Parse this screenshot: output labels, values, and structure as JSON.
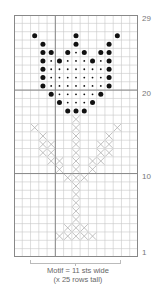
{
  "chart_data": {
    "type": "table",
    "grid": {
      "columns": 15,
      "rows": 29,
      "row_numbering": "bottom-to-top",
      "thick_lines_above_rows": [
        20,
        10
      ],
      "thick_line_after_column": 5
    },
    "row_labels": [
      "29",
      "20",
      "10",
      "1"
    ],
    "legend": {
      "large_dot": "bobble/contrast stitch (outline)",
      "small_dot": "contrast stitch (fill)",
      "x": "cross stitch (stem and leaves)"
    },
    "cells": {
      "large_dot": [
        [
          27,
          [
            2,
            7,
            12
          ]
        ],
        [
          26,
          [
            3,
            7,
            11
          ]
        ],
        [
          25,
          [
            3,
            4,
            6,
            8,
            10,
            11
          ]
        ],
        [
          24,
          [
            3,
            5,
            9,
            11
          ]
        ],
        [
          23,
          [
            3,
            11
          ]
        ],
        [
          22,
          [
            3,
            11
          ]
        ],
        [
          21,
          [
            3,
            11
          ]
        ],
        [
          20,
          [
            4,
            10
          ]
        ],
        [
          19,
          [
            5,
            9
          ]
        ],
        [
          18,
          [
            6,
            7,
            8
          ]
        ]
      ],
      "small_dot": [
        [
          25,
          [
            7
          ]
        ],
        [
          24,
          [
            4,
            6,
            7,
            8,
            10
          ]
        ],
        [
          23,
          [
            4,
            5,
            6,
            7,
            8,
            9,
            10
          ]
        ],
        [
          22,
          [
            4,
            5,
            6,
            7,
            8,
            9,
            10
          ]
        ],
        [
          21,
          [
            4,
            5,
            6,
            7,
            8,
            9,
            10
          ]
        ],
        [
          20,
          [
            5,
            6,
            7,
            8,
            9
          ]
        ],
        [
          19,
          [
            6,
            7,
            8
          ]
        ]
      ],
      "cross": [
        [
          17,
          [
            7
          ]
        ],
        [
          16,
          [
            2,
            7,
            12
          ]
        ],
        [
          15,
          [
            3,
            7,
            11
          ]
        ],
        [
          14,
          [
            3,
            4,
            7,
            10,
            11
          ]
        ],
        [
          13,
          [
            3,
            4,
            7,
            10,
            11
          ]
        ],
        [
          12,
          [
            4,
            5,
            7,
            9,
            10
          ]
        ],
        [
          11,
          [
            5,
            7,
            9
          ]
        ],
        [
          10,
          [
            6,
            7,
            8
          ]
        ],
        [
          9,
          [
            7
          ]
        ],
        [
          8,
          [
            7
          ]
        ],
        [
          7,
          [
            7
          ]
        ],
        [
          6,
          [
            7
          ]
        ],
        [
          5,
          [
            7
          ]
        ],
        [
          4,
          [
            6,
            7,
            8
          ]
        ],
        [
          3,
          [
            5,
            6,
            7,
            8,
            9
          ]
        ]
      ]
    },
    "motif_bracket": {
      "from_column": 2,
      "to_column": 12
    },
    "caption": [
      "Motif = 11 sts wide",
      "(x 25 rows tall)"
    ]
  },
  "labels": {
    "row_29": "29",
    "row_20": "20",
    "row_10": "10",
    "row_1": "1"
  },
  "caption": {
    "line1": "Motif = 11 sts wide",
    "line2": "(x 25 rows tall)"
  },
  "colors": {
    "grid_line": "#c8c8c8",
    "thick_line": "#888888",
    "dot": "#111111",
    "cross": "#b0b0b0"
  }
}
